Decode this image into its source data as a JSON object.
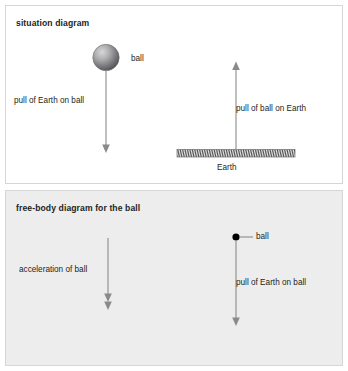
{
  "figure": {
    "panels": [
      {
        "id": "situation",
        "heading": "situation diagram",
        "background_color": "#ffffff",
        "border_color": "#d6d6d6",
        "elements": {
          "ball_label": "ball",
          "ball_shape": "shaded-sphere",
          "ball_force_label": "pull of Earth on ball",
          "ball_force_direction": "down",
          "earth_label": "Earth",
          "earth_shape": "hatched-ground-bar",
          "earth_force_label": "pull of ball on Earth",
          "earth_force_direction": "up"
        }
      },
      {
        "id": "free-body",
        "heading": "free-body diagram for the ball",
        "background_color": "#ededed",
        "border_color": "#d6d6d6",
        "elements": {
          "acceleration_label": "acceleration of ball",
          "acceleration_direction": "down",
          "acceleration_arrowhead": "double",
          "ball_label": "ball",
          "ball_shape": "point-particle-dot",
          "force_label": "pull of Earth on ball",
          "force_direction": "down",
          "force_arrowhead": "single"
        }
      }
    ],
    "colors": {
      "arrow": "#8a8a8a",
      "text": "#231f20",
      "dot": "#000000",
      "sphere_light": "#d8d8d8",
      "sphere_dark": "#56565a",
      "ground_fill": "#f2f2f2",
      "ground_hatch": "#4d4d4d"
    }
  }
}
